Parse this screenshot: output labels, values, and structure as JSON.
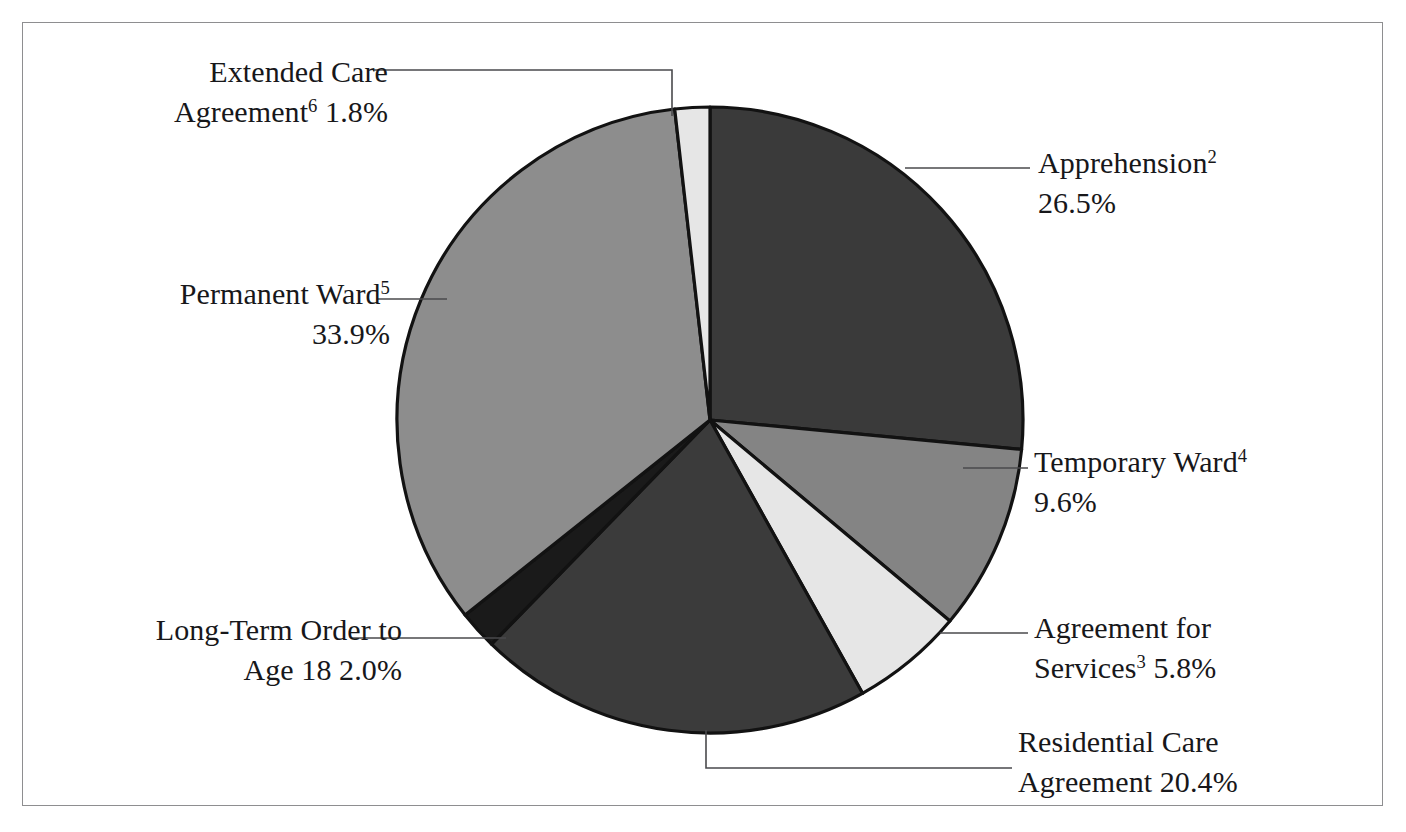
{
  "chart_data": {
    "type": "pie",
    "title": "",
    "subtitle": "",
    "xlabel": "",
    "ylabel": "",
    "legend_position": "none",
    "grid": false,
    "units": "percent",
    "total": 100.0,
    "start_angle_deg": 0,
    "direction": "clockwise",
    "categories": [
      "Apprehension",
      "Temporary Ward",
      "Agreement for Services",
      "Residential Care Agreement",
      "Long-Term Order to Age 18",
      "Permanent Ward",
      "Extended Care Agreement"
    ],
    "values": [
      26.5,
      9.6,
      5.8,
      20.4,
      2.0,
      33.9,
      1.8
    ],
    "slices": [
      {
        "key": "apprehension",
        "name": "Apprehension",
        "footnote": "2",
        "value": 26.5,
        "value_label": "26.5%",
        "color": "#3a3a3a",
        "label_line1": "Apprehension",
        "label_line2": "26.5%"
      },
      {
        "key": "temporary-ward",
        "name": "Temporary Ward",
        "footnote": "4",
        "value": 9.6,
        "value_label": "9.6%",
        "color": "#848484",
        "label_line1": "Temporary Ward",
        "label_line2": "9.6%"
      },
      {
        "key": "agreement-for-services",
        "name": "Agreement for Services",
        "footnote": "3",
        "value": 5.8,
        "value_label": "5.8%",
        "color": "#e6e6e6",
        "label_line1": "Agreement for",
        "label_line2": "Services",
        "label_line2_tail": " 5.8%"
      },
      {
        "key": "residential-care-agreement",
        "name": "Residential Care Agreement",
        "footnote": "",
        "value": 20.4,
        "value_label": "20.4%",
        "color": "#3b3b3b",
        "label_line1": "Residential Care",
        "label_line2": "Agreement 20.4%"
      },
      {
        "key": "long-term-order",
        "name": "Long-Term Order to Age 18",
        "footnote": "",
        "value": 2.0,
        "value_label": "2.0%",
        "color": "#1a1a1a",
        "label_line1": "Long-Term Order to",
        "label_line2": "Age 18 2.0%"
      },
      {
        "key": "permanent-ward",
        "name": "Permanent Ward",
        "footnote": "5",
        "value": 33.9,
        "value_label": "33.9%",
        "color": "#8d8d8d",
        "label_line1": "Permanent Ward",
        "label_line2": "33.9%"
      },
      {
        "key": "extended-care-agreement",
        "name": "Extended Care Agreement",
        "footnote": "6",
        "value": 1.8,
        "value_label": "1.8%",
        "color": "#e6e6e6",
        "label_line1": "Extended Care",
        "label_line2": "Agreement",
        "label_line2_tail": " 1.8%"
      }
    ]
  },
  "labels": {
    "apprehension": {
      "line1": "Apprehension",
      "sup": "2",
      "line2": "26.5%"
    },
    "temporary": {
      "line1": "Temporary Ward",
      "sup": "4",
      "line2": "9.6%"
    },
    "services": {
      "line1": "Agreement for",
      "line2a": "Services",
      "sup": "3",
      "line2b": " 5.8%"
    },
    "residential": {
      "line1": "Residential Care",
      "line2": "Agreement 20.4%"
    },
    "longterm": {
      "line1": "Long-Term Order to",
      "line2": "Age 18 2.0%"
    },
    "permanent": {
      "line1": "Permanent Ward",
      "sup": "5",
      "line2": "33.9%"
    },
    "extended": {
      "line1": "Extended Care",
      "line2a": "Agreement",
      "sup": "6",
      "line2b": " 1.8%"
    }
  },
  "style": {
    "background": "#ffffff",
    "frame_border": "#8e8e90",
    "slice_outline": "#121212",
    "leader_line": "#4a4a4d",
    "text": "#17171a"
  },
  "geometry": {
    "center_x": 710,
    "center_y": 420,
    "radius": 313
  }
}
